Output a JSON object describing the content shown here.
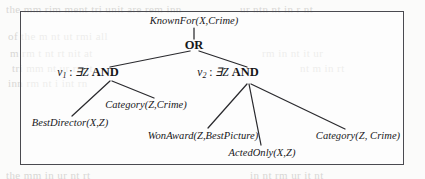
{
  "figure": {
    "type": "and-or-query-tree",
    "frame": {
      "x": 20,
      "y": 11,
      "width": 384,
      "height": 154,
      "border_color": "#4a4a50"
    },
    "canvas": {
      "width": 425,
      "height": 179,
      "background": "#fbfbfa"
    },
    "ink_color": "#17171a"
  },
  "nodes": {
    "root": {
      "label": "KnownFor(X,Crime)",
      "x": 194,
      "y": 21,
      "style": "predicate"
    },
    "or": {
      "label": "OR",
      "x": 194,
      "y": 45,
      "style": "operator"
    },
    "and_left": {
      "nu": "ν",
      "subscript": "1",
      "separator": " : ",
      "quantifier": "∃Z",
      "operator": "AND",
      "x": 88,
      "y": 73,
      "style": "variable-operator"
    },
    "and_right": {
      "nu": "ν",
      "subscript": "2",
      "separator": " : ",
      "quantifier": "∃Z",
      "operator": "AND",
      "x": 228,
      "y": 73,
      "style": "variable-operator"
    },
    "leaf_best_director": {
      "label": "BestDirector(X,Z)",
      "x": 70,
      "y": 123,
      "style": "predicate"
    },
    "leaf_category_left": {
      "label": "Category(Z,Crime)",
      "x": 146,
      "y": 105,
      "style": "predicate"
    },
    "leaf_won_award": {
      "label": "WonAward(Z,BestPicture)",
      "x": 203,
      "y": 136,
      "style": "predicate"
    },
    "leaf_acted_only": {
      "label": "ActedOnly(X,Z)",
      "x": 262,
      "y": 153,
      "style": "predicate"
    },
    "leaf_category_right": {
      "label": "Category(Z, Crime)",
      "x": 358,
      "y": 136,
      "style": "predicate"
    }
  },
  "edges": [
    {
      "name": "root-to-or",
      "x1": 194,
      "y1": 28,
      "x2": 194,
      "y2": 39
    },
    {
      "name": "or-to-and-left",
      "x1": 190,
      "y1": 51,
      "x2": 110,
      "y2": 67
    },
    {
      "name": "or-to-and-right",
      "x1": 199,
      "y1": 51,
      "x2": 247,
      "y2": 67
    },
    {
      "name": "and-left-to-best-director",
      "x1": 110,
      "y1": 81,
      "x2": 72,
      "y2": 116
    },
    {
      "name": "and-left-to-category-left",
      "x1": 112,
      "y1": 81,
      "x2": 154,
      "y2": 98
    },
    {
      "name": "and-right-to-won-award",
      "x1": 247,
      "y1": 84,
      "x2": 208,
      "y2": 128
    },
    {
      "name": "and-right-to-acted-only",
      "x1": 249,
      "y1": 84,
      "x2": 261,
      "y2": 145
    },
    {
      "name": "and-right-to-category-right",
      "x1": 251,
      "y1": 84,
      "x2": 345,
      "y2": 129
    }
  ],
  "background_ghost_text": [
    {
      "text": "the  mm  rim  ment  tri  unit  are  rem  inn",
      "x": 6,
      "y": 3
    },
    {
      "text": "of   the   m   nt      ut    rmi   all",
      "x": 8,
      "y": 30
    },
    {
      "text": "m       rm  t  nt    rt   nit  at",
      "x": 10,
      "y": 47
    },
    {
      "text": "tri   mm   nt    ur   rn   it",
      "x": 12,
      "y": 62
    },
    {
      "text": "inn    rm   nt   i   int   rn",
      "x": 8,
      "y": 77
    },
    {
      "text": "ur  ntn  nt  in  r  nt",
      "x": 240,
      "y": 3
    },
    {
      "text": "rm  in  nt  it  ur",
      "x": 262,
      "y": 47
    },
    {
      "text": "nt  m  in  rt",
      "x": 300,
      "y": 62
    },
    {
      "text": "the   mm   in   ur   nt    rt",
      "x": 6,
      "y": 169
    },
    {
      "text": "in  nt  rm  ur  it  nt",
      "x": 250,
      "y": 169
    }
  ]
}
